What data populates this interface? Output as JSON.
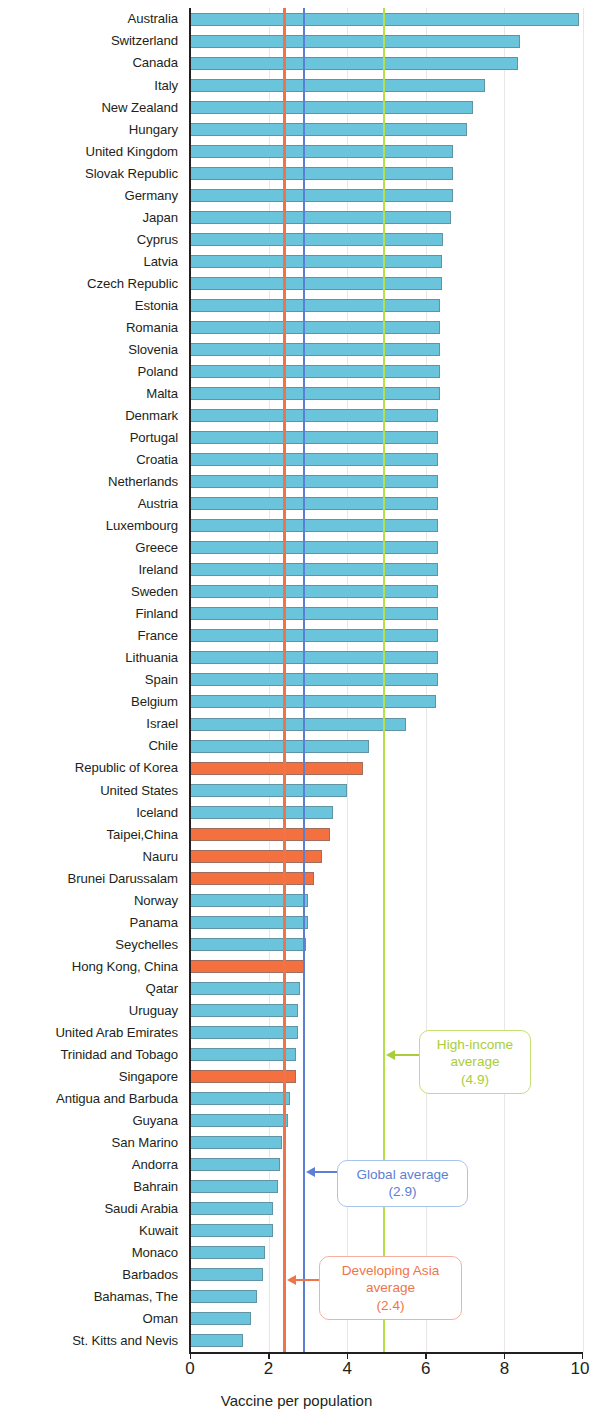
{
  "chart_data": {
    "type": "bar",
    "orientation": "horizontal",
    "title": "",
    "xlabel": "Vaccine per population",
    "ylabel": "",
    "xlim": [
      0,
      10
    ],
    "xticks": [
      0,
      2,
      4,
      6,
      8,
      10
    ],
    "xtick_labels": [
      "0",
      "2",
      "4",
      "6",
      "8",
      "10"
    ],
    "grid": true,
    "legend": "none",
    "series_colors": {
      "default": "#69c4dc",
      "highlight": "#f4703f",
      "high_income_line": "#b5e04a",
      "global_line": "#5b7fd4",
      "developing_asia_line": "#f0744a"
    },
    "categories": [
      "Australia",
      "Switzerland",
      "Canada",
      "Italy",
      "New Zealand",
      "Hungary",
      "United Kingdom",
      "Slovak Republic",
      "Germany",
      "Japan",
      "Cyprus",
      "Latvia",
      "Czech Republic",
      "Estonia",
      "Romania",
      "Slovenia",
      "Poland",
      "Malta",
      "Denmark",
      "Portugal",
      "Croatia",
      "Netherlands",
      "Austria",
      "Luxembourg",
      "Greece",
      "Ireland",
      "Sweden",
      "Finland",
      "France",
      "Lithuania",
      "Spain",
      "Belgium",
      "Israel",
      "Chile",
      "Republic of Korea",
      "United States",
      "Iceland",
      "Taipei,China",
      "Nauru",
      "Brunei Darussalam",
      "Norway",
      "Panama",
      "Seychelles",
      "Hong Kong, China",
      "Qatar",
      "Uruguay",
      "United Arab Emirates",
      "Trinidad and Tobago",
      "Singapore",
      "Antigua and Barbuda",
      "Guyana",
      "San Marino",
      "Andorra",
      "Bahrain",
      "Saudi Arabia",
      "Kuwait",
      "Monaco",
      "Barbados",
      "Bahamas, The",
      "Oman",
      "St. Kitts and Nevis"
    ],
    "values": [
      9.9,
      8.4,
      8.35,
      7.5,
      7.2,
      7.05,
      6.7,
      6.7,
      6.7,
      6.65,
      6.45,
      6.4,
      6.4,
      6.35,
      6.35,
      6.35,
      6.35,
      6.35,
      6.3,
      6.3,
      6.3,
      6.3,
      6.3,
      6.3,
      6.3,
      6.3,
      6.3,
      6.3,
      6.3,
      6.3,
      6.3,
      6.25,
      5.5,
      4.55,
      4.4,
      4.0,
      3.65,
      3.55,
      3.35,
      3.15,
      3.0,
      3.0,
      2.95,
      2.9,
      2.8,
      2.75,
      2.75,
      2.7,
      2.7,
      2.55,
      2.5,
      2.35,
      2.3,
      2.25,
      2.1,
      2.1,
      1.9,
      1.85,
      1.7,
      1.55,
      1.35
    ],
    "highlighted": [
      "Republic of Korea",
      "Taipei,China",
      "Nauru",
      "Brunei Darussalam",
      "Hong Kong, China",
      "Singapore"
    ],
    "reference_lines": [
      {
        "name": "High-income average",
        "value": 4.9,
        "color": "#b5e04a",
        "label_lines": [
          "High-income",
          "average",
          "(4.9)"
        ]
      },
      {
        "name": "Global average",
        "value": 2.9,
        "color": "#5b7fd4",
        "label_lines": [
          "Global average",
          "(2.9)"
        ]
      },
      {
        "name": "Developing Asia average",
        "value": 2.4,
        "color": "#f0744a",
        "label_lines": [
          "Developing Asia",
          "average",
          "(2.4)"
        ]
      }
    ]
  },
  "axis": {
    "x_title": "Vaccine per population",
    "ticks": [
      "0",
      "2",
      "4",
      "6",
      "8",
      "10"
    ]
  },
  "callouts": {
    "high_income": {
      "line1": "High-income",
      "line2": "average",
      "line3": "(4.9)"
    },
    "global": {
      "line1": "Global average",
      "line2": "(2.9)"
    },
    "developing_asia": {
      "line1": "Developing Asia",
      "line2": "average",
      "line3": "(2.4)"
    }
  }
}
